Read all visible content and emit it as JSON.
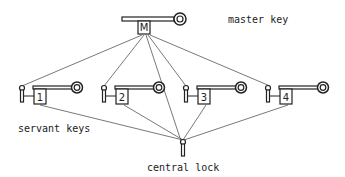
{
  "labels": {
    "master_key": "master key",
    "servant_keys": "servant keys",
    "central_lock": "central lock"
  },
  "master_key": {
    "tag": "M"
  },
  "servant_keys": [
    {
      "tag": "1"
    },
    {
      "tag": "2"
    },
    {
      "tag": "3"
    },
    {
      "tag": "4"
    }
  ],
  "connections": {
    "master_to": [
      "lock-1",
      "lock-2",
      "central-lock",
      "lock-3",
      "lock-4"
    ],
    "servants_to": "central-lock"
  },
  "colors": {
    "ink": "#222222",
    "line": "#555555",
    "background": "#ffffff"
  }
}
